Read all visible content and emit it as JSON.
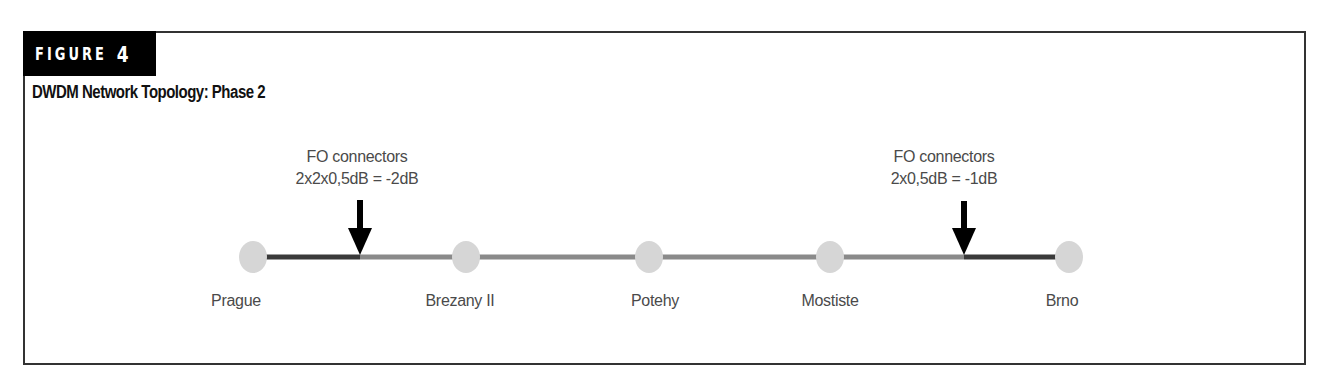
{
  "figure": {
    "badge_word": "FIGURE",
    "badge_number": "4",
    "title": "DWDM Network Topology: Phase 2"
  },
  "colors": {
    "node_fill": "#d6d6d6",
    "span_dark": "#3a3a3a",
    "span_light": "#8a8a8a",
    "arrow": "#000000",
    "label_text": "#4a4a4a",
    "frame": "#333333"
  },
  "nodes": [
    {
      "id": "prague",
      "label": "Prague",
      "x": 253,
      "label_x": 236
    },
    {
      "id": "brezany",
      "label": "Brezany II",
      "x": 466,
      "label_x": 460
    },
    {
      "id": "potehy",
      "label": "Potehy",
      "x": 649,
      "label_x": 655
    },
    {
      "id": "mostiste",
      "label": "Mostiste",
      "x": 830,
      "label_x": 830
    },
    {
      "id": "brno",
      "label": "Brno",
      "x": 1069,
      "label_x": 1062
    }
  ],
  "spans": [
    {
      "from": "prague",
      "to": "brezany",
      "segments": [
        {
          "x1": 266,
          "x2": 360,
          "style": "dark"
        },
        {
          "x1": 360,
          "x2": 453,
          "style": "light"
        }
      ]
    },
    {
      "from": "brezany",
      "to": "potehy",
      "segments": [
        {
          "x1": 479,
          "x2": 636,
          "style": "light"
        }
      ]
    },
    {
      "from": "potehy",
      "to": "mostiste",
      "segments": [
        {
          "x1": 662,
          "x2": 817,
          "style": "light"
        }
      ]
    },
    {
      "from": "mostiste",
      "to": "brno",
      "segments": [
        {
          "x1": 843,
          "x2": 964,
          "style": "light"
        },
        {
          "x1": 964,
          "x2": 1056,
          "style": "dark"
        }
      ]
    }
  ],
  "annotations": [
    {
      "line1": "FO connectors",
      "line2": "2x2x0,5dB = -2dB",
      "arrow_x": 360,
      "text_x": 357
    },
    {
      "line1": "FO connectors",
      "line2": "2x0,5dB = -1dB",
      "arrow_x": 964,
      "text_x": 944
    }
  ]
}
